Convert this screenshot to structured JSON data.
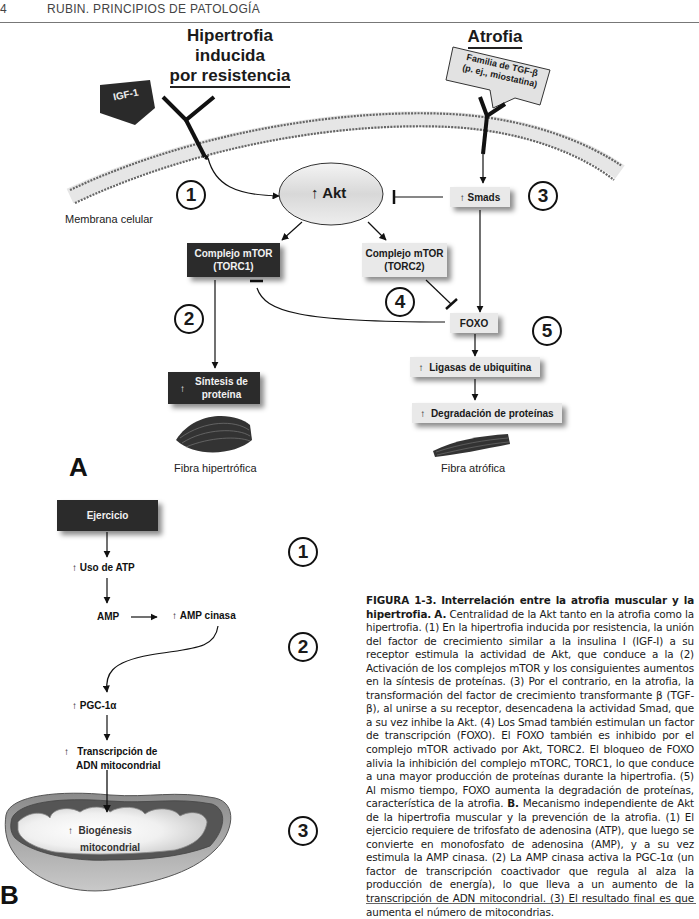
{
  "header": {
    "page_number": "4",
    "book_title": "RUBIN. PRINCIPIOS DE PATOLOGÍA"
  },
  "panel_a": {
    "letter": "A",
    "title_left_line1": "Hipertrofia inducida",
    "title_left_line2": "por resistencia",
    "title_right": "Atrofia",
    "igf_label": "IGF-1",
    "tgf_label_line1": "Familia de TGF-β",
    "tgf_label_line2": "(p. ej., miostatina)",
    "membrane_label": "Membrana celular",
    "akt_label": "Akt",
    "smads_label": "Smads",
    "torc1_line1": "Complejo mTOR",
    "torc1_line2": "(TORC1)",
    "torc2_line1": "Complejo mTOR",
    "torc2_line2": "(TORC2)",
    "foxo_label": "FOXO",
    "synthesis_line1": "Síntesis de",
    "synthesis_line2": "proteína",
    "ligases_label": "Ligasas de ubiquitina",
    "degradation_label": "Degradación de proteínas",
    "fiber_hyper_label": "Fibra hipertrófica",
    "fiber_atrophy_label": "Fibra atrófica",
    "steps": [
      "1",
      "2",
      "3",
      "4",
      "5"
    ]
  },
  "panel_b": {
    "letter": "B",
    "exercise_label": "Ejercicio",
    "atp_label": "Uso de ATP",
    "amp_label": "AMP",
    "ampk_label": "AMP cinasa",
    "pgc_label": "PGC-1α",
    "transcription_line1": "Transcripción de",
    "transcription_line2": "ADN mitocondrial",
    "biogenesis_line1": "Biogénesis",
    "biogenesis_line2": "mitocondrial",
    "steps": [
      "1",
      "2",
      "3"
    ]
  },
  "caption": {
    "figure_id": "FIGURA 1-3.",
    "figure_title": "Interrelación entre la atrofia muscular y la hipertrofia.",
    "a_marker": "A.",
    "a_text": "Centralidad de la Akt tanto en la atrofia como la hipertrofia. (1) En la hipertrofia inducida por resistencia, la unión del factor de crecimiento similar a la insulina I (IGF-I) a su receptor estimula la actividad de Akt, que conduce a la (2) Activación de los complejos mTOR y los consiguientes aumentos en la síntesis de proteínas. (3) Por el contrario, en la atrofia, la transformación del factor de crecimiento transformante β (TGF-β), al unirse a su receptor, desencadena la actividad Smad, que a su vez inhibe la Akt. (4) Los Smad también estimulan un factor de transcripción (FOXO). El FOXO también es inhibido por el complejo mTOR activado por Akt, TORC2. El bloqueo de FOXO alivia la inhibición del complejo mTORC, TORC1, lo que conduce a una mayor producción de proteínas durante la hipertrofia. (5) Al mismo tiempo, FOXO aumenta la degradación de proteínas, característica de la atrofia.",
    "b_marker": "B.",
    "b_text": "Mecanismo independiente de Akt de la hipertrofia muscular y la prevención de la atrofia. (1) El ejercicio requiere de trifosfato de adenosina (ATP), que luego se convierte en monofosfato de adenosina (AMP), y a su vez estimula la AMP cinasa. (2) La AMP cinasa activa la PGC-1α (un factor de transcripción coactivador que regula al alza la producción de energía), lo que lleva a un aumento de la transcripción de ADN mitocondrial. (3) El resultado final es que aumenta el número de mitocondrias."
  },
  "icons": {
    "up_arrow": "↑"
  }
}
